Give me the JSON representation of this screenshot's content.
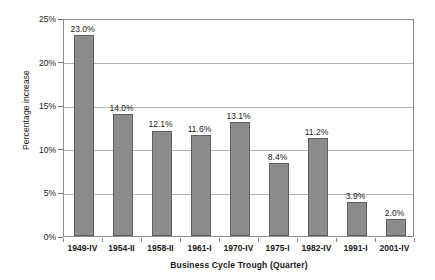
{
  "chart_data": {
    "type": "bar",
    "title": "",
    "subtitle": "",
    "xlabel": "Business Cycle Trough (Quarter)",
    "ylabel": "Percentage increase",
    "categories": [
      "1949-IV",
      "1954-II",
      "1958-II",
      "1961-I",
      "1970-IV",
      "1975-I",
      "1982-IV",
      "1991-I",
      "2001-IV"
    ],
    "values": [
      23.0,
      14.0,
      12.1,
      11.6,
      13.1,
      8.4,
      11.2,
      3.9,
      2.0
    ],
    "value_labels": [
      "23.0%",
      "14.0%",
      "12.1%",
      "11.6%",
      "13.1%",
      "8.4%",
      "11.2%",
      "3.9%",
      "2.0%"
    ],
    "ylim": [
      0,
      25
    ],
    "y_ticks": [
      0,
      5,
      10,
      15,
      20,
      25
    ],
    "y_tick_labels": [
      "0%",
      "5%",
      "10%",
      "15%",
      "20%",
      "25%"
    ],
    "grid": true,
    "grid_axis": "y",
    "legend": false,
    "legend_position": "none",
    "bar_color": "#8c8c8c",
    "bar_border_color": "#5e5e5e",
    "grid_color": "#b4b4b4",
    "frame_color": "#8c8c8c",
    "text_color": "#1a1a1a",
    "background": "#ffffff"
  }
}
